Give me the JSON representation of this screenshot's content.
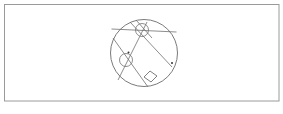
{
  "figure": {
    "frame": {
      "x": 4.5,
      "y": 4.5,
      "width": 274.5,
      "height": 96.5,
      "stroke": "#9a9a9a"
    },
    "main_circle": {
      "cx": 144,
      "cy": 53,
      "r": 33.5,
      "stroke": "#6b6b6b"
    },
    "small_circles": [
      {
        "name": "circle-top",
        "cx": 142,
        "cy": 30,
        "r": 6.5
      },
      {
        "name": "circle-left",
        "cx": 126,
        "cy": 60,
        "r": 6.5
      }
    ],
    "chords": [
      {
        "name": "chord-horizontal",
        "x1": 111.5,
        "y1": 29,
        "x2": 176.5,
        "y2": 32
      },
      {
        "name": "chord-top-to-lower-left",
        "x1": 147,
        "y1": 22,
        "x2": 118,
        "y2": 80
      },
      {
        "name": "chord-top-left-to-right",
        "x1": 130,
        "y1": 22,
        "x2": 172,
        "y2": 67
      },
      {
        "name": "chord-left-to-bottom",
        "x1": 113,
        "y1": 38,
        "x2": 148,
        "y2": 87
      },
      {
        "name": "chord-top-small",
        "x1": 136,
        "y1": 20,
        "x2": 152,
        "y2": 38
      }
    ],
    "square": {
      "points": "144,77 150,71 157,76 151,82"
    },
    "dots": [
      {
        "name": "dot-left",
        "cx": 128.5,
        "cy": 52.5
      },
      {
        "name": "dot-right",
        "cx": 172,
        "cy": 63
      }
    ],
    "stroke_color": "#707070"
  }
}
